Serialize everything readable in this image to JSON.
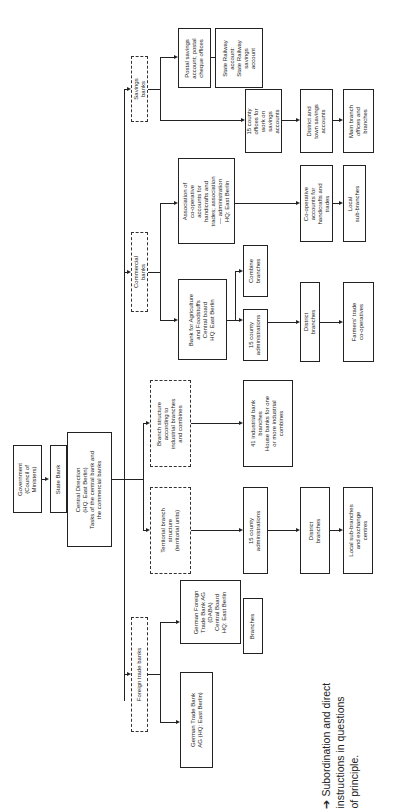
{
  "diagram": {
    "orientation": "rotated-90-ccw",
    "nodes": {
      "government": "Government\n(Council of\nMinisters)",
      "state_bank": "State Bank",
      "central_direction": "Central Direction\n(HQ: East Berlin)\nTasks of the central bank and\nthe commercial banks",
      "savings_banks": "Savings\nbanks",
      "postal_savings": "Postal savings\naccount; postal\ncheque offices",
      "state_railway": "State Railway\naccount:\nState Railway\nsavings\naccount",
      "county_offices_savings": "15 county\noffices for\nwork on\nsavings\naccounts",
      "district_town_savings": "District and\ntown savings\naccounts",
      "main_branch_offices": "Main branch\noffices and\nbranches",
      "commercial_banks": "Commercial\nbanks",
      "association_coop": "Association of\nco-operative\naccounts for\nhandicrafts and\ntrades; association\n— administration\nHQ: East Berlin",
      "coop_accounts": "Co-operative\naccounts for\nhandicrafts and\ntrades",
      "local_sub_branches_coop": "Local\nsub-branches",
      "bank_agriculture": "Bank for Agriculture\nand Foodstuffs\nCentral board\nHQ: East Berlin",
      "combine_branches": "Combine\nbranches",
      "county_admin_agri": "15 county\nadministrations",
      "district_branches_agri": "District\nbranches",
      "farmers_trade": "Farmers' trade\nco-operatives",
      "branch_structure_industrial": "Branch structure\naccording to\nindustrial branches\nand combines",
      "industrial_bank_branches": "41 industrial bank\nbranches\nHouse banks for one\nor more industrial\ncombines",
      "territorial_branch": "Territorial branch\nstructure\n(territorial units)",
      "county_admin_terr": "15 county\nadministrations",
      "district_branches_terr": "District\nbranches",
      "local_sub_branches_exchange": "Local sub-branches\nand exchange\ncentres",
      "foreign_trade_banks": "Foreign trade banks",
      "german_foreign_trade_bank": "German Foreign\nTrade Bank AG\n(DABA)\nCentral Board\nHQ: East Berlin",
      "branches_daba": "Branches",
      "german_trade_bank": "German Trade Bank\nAG (HQ: East Berlin)"
    },
    "legend": {
      "text": "➔ Subordination and direct\n   instructions in questions\n   of principle."
    }
  }
}
